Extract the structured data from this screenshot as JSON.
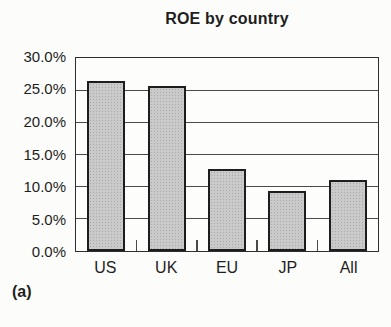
{
  "figure_label": "(a)",
  "chart_data": {
    "type": "bar",
    "title": "ROE by country",
    "categories": [
      "US",
      "UK",
      "EU",
      "JP",
      "All"
    ],
    "values": [
      26.4,
      25.7,
      12.7,
      9.4,
      11.0
    ],
    "value_unit": "percent",
    "ylim": [
      0,
      30
    ],
    "ytick_labels_top_to_bottom": [
      "30.0%",
      "25.0%",
      "20.0%",
      "15.0%",
      "10.0%",
      "5.0%",
      "0.0%"
    ],
    "grid": "horizontal",
    "legend": "none",
    "colors": {
      "background": "#fcfcfa",
      "text": "#1e1e1e",
      "plot_border": "#2e2e2e",
      "gridline": "#4a4a4a",
      "bar_fill": "#cacaca",
      "bar_border": "#1d1d1d"
    }
  }
}
